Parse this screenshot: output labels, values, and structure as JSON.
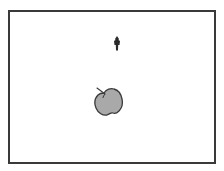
{
  "scene": {
    "arena": {
      "border_color": "#3a3a3a",
      "background": "#ffffff"
    },
    "player": {
      "icon": "player-figure-icon",
      "color": "#2a2a2a",
      "x": 114,
      "y": 37
    },
    "apple": {
      "icon": "apple-icon",
      "fill": "#a9a9a9",
      "outline": "#3a3a3a",
      "x": 94,
      "y": 86
    }
  }
}
